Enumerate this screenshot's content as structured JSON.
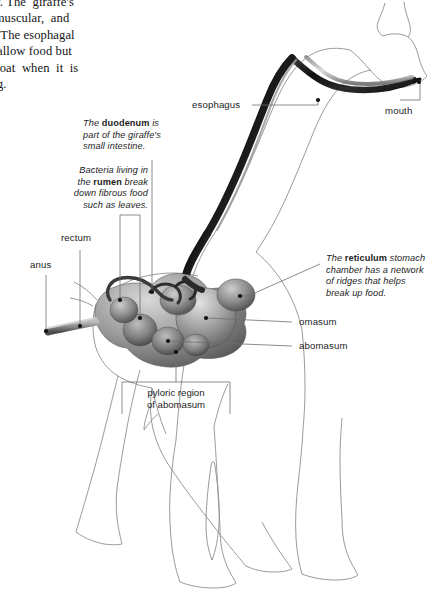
{
  "document": {
    "body_text": "sionally. The  giraffe's\ng and  muscular,  and\nomach. The esophagal\ny to swallow food but\n the  throat  when  it  is\nchewing."
  },
  "diagram": {
    "labels": {
      "esophagus": "esophagus",
      "mouth": "mouth",
      "rectum": "rectum",
      "anus": "anus",
      "omasum": "omasum",
      "abomasum": "abomasum"
    },
    "notes": {
      "duodenum": {
        "line1_pre": "The ",
        "line1_bold": "duodenum",
        "line1_post": " is",
        "line2": "part of the giraffe's",
        "line3": "small intestine."
      },
      "rumen": {
        "line1": "Bacteria living in",
        "line2_pre": "the ",
        "line2_bold": "rumen",
        "line2_post": " break",
        "line3": "down fibrous food",
        "line4": "such as leaves."
      },
      "reticulum": {
        "line1_pre": "The ",
        "line1_bold": "reticulum",
        "line1_post": " stomach",
        "line2": "chamber has a network",
        "line3": "of ridges that helps",
        "line4": "break up food."
      },
      "pyloric": {
        "line1": "pyloric region",
        "line2": "of abomasum"
      }
    },
    "colors": {
      "silhouette_outline": "#8f8f8f",
      "leader_line": "#6e6e6e",
      "organ_dark": "#1a1a1a",
      "organ_mid": "#7a7a7a",
      "organ_light": "#c9c9c9",
      "text": "#1d1d1d",
      "background": "#ffffff"
    }
  }
}
